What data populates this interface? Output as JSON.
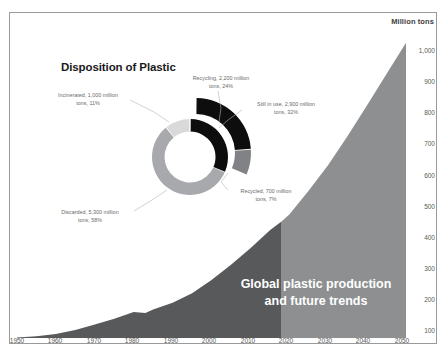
{
  "figure": {
    "axis_unit_label": "Million tons",
    "donut_title": "Disposition of Plastic",
    "area_caption_line1": "Global plastic production",
    "area_caption_line2": "and future trends"
  },
  "colors": {
    "historical_area": "#58595b",
    "projected_area": "#8d8f91",
    "donut_dark": "#0d0d0d",
    "donut_mid_gray": "#808285",
    "donut_light_gray": "#d9d9d9",
    "donut_medium_gray": "#a7a9ac",
    "frame_border": "#9a9a9a",
    "tick_text": "#595959",
    "callout_text": "#6b6b6b"
  },
  "callouts": {
    "incinerated": "Incinerated, 1,000 million tons, 11%",
    "recycling": "Recycling, 2,200 million tons, 24%",
    "still_in_use": "Still in use, 2,900 million tons, 32%",
    "recycled": "Recycled, 700 million tons, 7%",
    "discarded": "Discarded, 5,300 million tons, 58%"
  },
  "chart_data": [
    {
      "type": "area",
      "title": "Global plastic production and future trends",
      "xlabel": "",
      "ylabel": "Million tons",
      "xlim": [
        1950,
        2050
      ],
      "ylim": [
        0,
        1050
      ],
      "grid": false,
      "legend": "none",
      "yticks": [
        100,
        200,
        300,
        400,
        500,
        600,
        700,
        800,
        900,
        1000
      ],
      "ytick_labels": [
        "100",
        "200",
        "300",
        "400",
        "500",
        "600",
        "700",
        "800",
        "900",
        "1,000"
      ],
      "xticks": [
        1950,
        1960,
        1970,
        1980,
        1990,
        2000,
        2010,
        2020,
        2030,
        2040,
        2050
      ],
      "xtick_labels": [
        "1950",
        "1960",
        "1970",
        "1980",
        "1990",
        "2000",
        "2010",
        "2020",
        "2030",
        "2040",
        "2050"
      ],
      "split_year": 2018,
      "series": [
        {
          "name": "Historical production",
          "color": "#58595b",
          "x": [
            1950,
            1955,
            1960,
            1965,
            1970,
            1975,
            1980,
            1983,
            1985,
            1990,
            1995,
            2000,
            2005,
            2010,
            2015,
            2018
          ],
          "values": [
            2,
            6,
            14,
            28,
            48,
            68,
            92,
            88,
            100,
            124,
            158,
            204,
            258,
            316,
            380,
            410
          ]
        },
        {
          "name": "Projected production",
          "color": "#8d8f91",
          "x": [
            2018,
            2020,
            2025,
            2030,
            2035,
            2040,
            2045,
            2050
          ],
          "values": [
            410,
            435,
            520,
            610,
            712,
            820,
            930,
            1040
          ]
        }
      ]
    },
    {
      "type": "pie",
      "title": "Disposition of Plastic",
      "subtype": "doughnut-with-exploded-outer-ring",
      "units": "million tons",
      "inner_ring": {
        "labels": [
          "Discarded",
          "Incinerated",
          "Still in use / Recycling"
        ],
        "values": [
          5300,
          1000,
          2900
        ],
        "percents": [
          58,
          11,
          32
        ],
        "colors": [
          "#a7a9ac",
          "#d9d9d9",
          "#0d0d0d"
        ]
      },
      "outer_ring": {
        "labels": [
          "Recycling",
          "Recycled"
        ],
        "values": [
          2200,
          700
        ],
        "percents": [
          24,
          7
        ],
        "colors": [
          "#0d0d0d",
          "#808285"
        ]
      },
      "slices": [
        {
          "label": "Discarded",
          "value": 5300,
          "percent": 58,
          "color": "#a7a9ac"
        },
        {
          "label": "Incinerated",
          "value": 1000,
          "percent": 11,
          "color": "#d9d9d9"
        },
        {
          "label": "Still in use",
          "value": 2900,
          "percent": 32,
          "color": "#0d0d0d"
        },
        {
          "label": "Recycling",
          "value": 2200,
          "percent": 24,
          "color": "#0d0d0d"
        },
        {
          "label": "Recycled",
          "value": 700,
          "percent": 7,
          "color": "#808285"
        }
      ]
    }
  ],
  "yticks": [
    {
      "label": "1,000",
      "top": 48
    },
    {
      "label": "900",
      "top": 79
    },
    {
      "label": "800",
      "top": 110
    },
    {
      "label": "700",
      "top": 141
    },
    {
      "label": "600",
      "top": 173
    },
    {
      "label": "500",
      "top": 204
    },
    {
      "label": "400",
      "top": 235
    },
    {
      "label": "300",
      "top": 266
    },
    {
      "label": "200",
      "top": 297
    },
    {
      "label": "100",
      "top": 328
    }
  ],
  "xticks": [
    {
      "label": "1950",
      "left": 16
    },
    {
      "label": "1960",
      "left": 55
    },
    {
      "label": "1970",
      "left": 93
    },
    {
      "label": "1980",
      "left": 132
    },
    {
      "label": "1990",
      "left": 170
    },
    {
      "label": "2000",
      "left": 209
    },
    {
      "label": "2010",
      "left": 247
    },
    {
      "label": "2020",
      "left": 286
    },
    {
      "label": "2030",
      "left": 324
    },
    {
      "label": "2040",
      "left": 363
    },
    {
      "label": "2050",
      "left": 401
    }
  ]
}
